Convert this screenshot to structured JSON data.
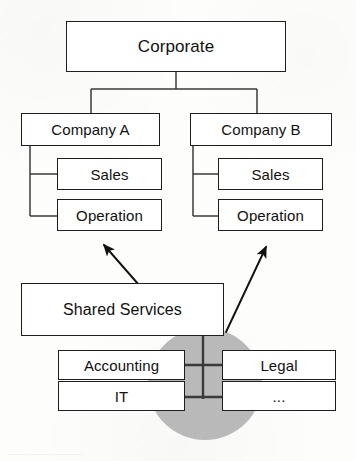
{
  "diagram": {
    "colors": {
      "background": "#fdfdfc",
      "box_fill": "#ffffff",
      "box_stroke": "#1e1e1e",
      "line": "#3a3a3a",
      "arrow": "#111111",
      "ellipse_fill": "#b9b9b9",
      "text": "#111111"
    },
    "nodes": {
      "corporate": {
        "label": "Corporate",
        "x": 66,
        "y": 21,
        "w": 220,
        "h": 51,
        "font_size": 17
      },
      "company_a": {
        "label": "Company A",
        "x": 21,
        "y": 113,
        "w": 139,
        "h": 33,
        "font_size": 15
      },
      "company_b": {
        "label": "Company B",
        "x": 190,
        "y": 113,
        "w": 142,
        "h": 33,
        "font_size": 15
      },
      "sales_a": {
        "label": "Sales",
        "x": 57,
        "y": 158,
        "w": 105,
        "h": 32,
        "font_size": 15
      },
      "operation_a": {
        "label": "Operation",
        "x": 57,
        "y": 199,
        "w": 105,
        "h": 32,
        "font_size": 15
      },
      "sales_b": {
        "label": "Sales",
        "x": 218,
        "y": 158,
        "w": 105,
        "h": 32,
        "font_size": 15
      },
      "operation_b": {
        "label": "Operation",
        "x": 218,
        "y": 199,
        "w": 105,
        "h": 32,
        "font_size": 15
      },
      "shared_services": {
        "label": "Shared Services",
        "x": 21,
        "y": 283,
        "w": 203,
        "h": 53,
        "font_size": 16
      },
      "accounting": {
        "label": "Accounting",
        "x": 58,
        "y": 350,
        "w": 127,
        "h": 30,
        "font_size": 15
      },
      "it": {
        "label": "IT",
        "x": 58,
        "y": 381,
        "w": 127,
        "h": 30,
        "font_size": 15
      },
      "legal": {
        "label": "Legal",
        "x": 222,
        "y": 350,
        "w": 114,
        "h": 30,
        "font_size": 15
      },
      "etc": {
        "label": "...",
        "x": 222,
        "y": 381,
        "w": 114,
        "h": 30,
        "font_size": 15
      }
    },
    "ellipse": {
      "cx": 205,
      "cy": 384,
      "rx": 57,
      "ry": 56
    },
    "arrows": [
      {
        "name": "shared-to-company-a",
        "x1": 139,
        "y1": 285,
        "x2": 104,
        "y2": 245
      },
      {
        "name": "shared-to-company-b",
        "x1": 226,
        "y1": 332,
        "x2": 266,
        "y2": 247
      }
    ],
    "bottom_artifact": "..................................."
  }
}
